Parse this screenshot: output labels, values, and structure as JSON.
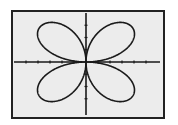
{
  "chart_data": {
    "type": "line",
    "title": "",
    "xlabel": "",
    "ylabel": "",
    "equation": "r = sin(2θ)",
    "theta_range": [
      0,
      6.283
    ],
    "xlim": [
      -1.5,
      1.5
    ],
    "ylim": [
      -1,
      1
    ],
    "x_ticks": [
      -1.25,
      -1,
      -0.75,
      -0.5,
      -0.25,
      0.25,
      0.5,
      0.75,
      1,
      1.25
    ],
    "y_ticks": [
      -0.75,
      -0.5,
      -0.25,
      0.25,
      0.5,
      0.75
    ],
    "grid": false,
    "legend": "none",
    "series": [
      {
        "name": "rose",
        "color": "#1a1a1a",
        "petals": 4
      }
    ]
  }
}
